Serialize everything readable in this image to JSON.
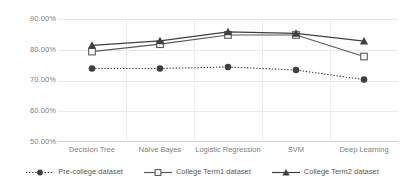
{
  "chart_data": {
    "type": "line",
    "title": "",
    "xlabel": "",
    "ylabel": "",
    "categories": [
      "Decision Tree",
      "Naïve Bayes",
      "Logistic Regression",
      "SVM",
      "Deep Learning"
    ],
    "ylim": [
      50,
      90
    ],
    "ytick_values": [
      90,
      80,
      70,
      60,
      50
    ],
    "ytick_labels": [
      "90.00%",
      "80.00%",
      "70.00%",
      "60.00%",
      "50.00%"
    ],
    "grid": true,
    "legend_position": "bottom",
    "series": [
      {
        "name": "Pre-college dataset",
        "values": [
          73.9,
          73.9,
          74.4,
          73.4,
          70.3
        ],
        "color": "#404040",
        "marker": "circle",
        "line_style": "dotted"
      },
      {
        "name": "College Term1 dataset",
        "values": [
          79.4,
          81.8,
          84.8,
          84.8,
          77.8
        ],
        "color": "#595959",
        "marker": "square-open",
        "line_style": "solid"
      },
      {
        "name": "College Term2 dataset",
        "values": [
          81.4,
          82.9,
          85.8,
          85.3,
          82.8
        ],
        "color": "#404040",
        "marker": "triangle",
        "line_style": "solid"
      }
    ]
  },
  "axes": {
    "y_ticks": [
      {
        "label": "90.00%",
        "value": 90
      },
      {
        "label": "80.00%",
        "value": 80
      },
      {
        "label": "70.00%",
        "value": 70
      },
      {
        "label": "60.00%",
        "value": 60
      },
      {
        "label": "50.00%",
        "value": 50
      }
    ],
    "x_ticks": [
      {
        "label": "Decision Tree"
      },
      {
        "label": "Naïve Bayes"
      },
      {
        "label": "Logistic Regression"
      },
      {
        "label": "SVM"
      },
      {
        "label": "Deep Learning"
      }
    ]
  },
  "legend": {
    "items": [
      {
        "label": "Pre-college dataset"
      },
      {
        "label": "College Term1 dataset"
      },
      {
        "label": "College Term2 dataset"
      }
    ]
  }
}
